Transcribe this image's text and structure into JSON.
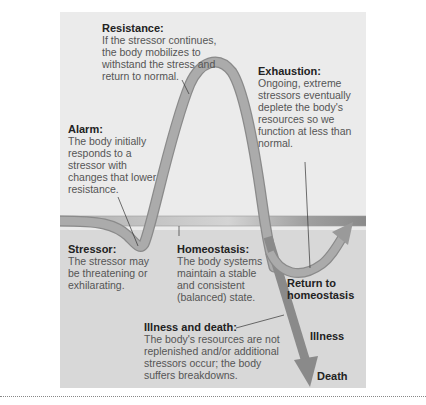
{
  "diagram": {
    "colors": {
      "panel_bg": "#ebebeb",
      "lower_bg": "#d8d8d8",
      "curve": "#a8a8a8",
      "curve_edge": "#8a8a8a",
      "band": "#b5b5b5",
      "arrow_dark": "#8c8c8c"
    },
    "labels": {
      "resistance": {
        "heading": "Resistance:",
        "text": "If the stressor continues, the body mobilizes to withstand the stress and return to normal."
      },
      "alarm": {
        "heading": "Alarm:",
        "text": "The body initially responds to a stressor with changes that lower resistance."
      },
      "exhaustion": {
        "heading": "Exhaustion:",
        "text": "Ongoing, extreme stressors eventually deplete the body's resources so we function at less than normal."
      },
      "stressor": {
        "heading": "Stressor:",
        "text": "The stressor may be threatening or exhilarating."
      },
      "homeostasis": {
        "heading": "Homeostasis:",
        "text": "The body systems maintain a stable and consistent (balanced) state."
      },
      "illness_death": {
        "heading": "Illness and death:",
        "text": "The body's resources are not replenished and/or additional stressors occur; the body suffers breakdowns."
      }
    },
    "outcomes": {
      "return": "Return to homeostasis",
      "illness": "Illness",
      "death": "Death"
    }
  }
}
